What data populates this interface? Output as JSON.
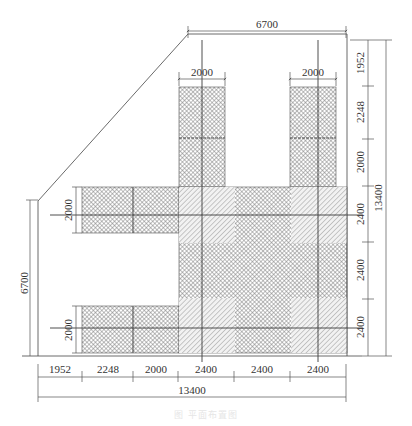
{
  "drawing": {
    "type": "structural plan with dimension lines",
    "colors": {
      "line": "#444444",
      "dim_line": "#555555",
      "crosshatch": "#8a8a8a",
      "diagonal_hatch": "#a8a8a8",
      "background": "#ffffff"
    },
    "top_dimensions": {
      "overall": "6700",
      "left_tower_width": "2000",
      "right_tower_width": "2000"
    },
    "right_dimensions": {
      "segments": [
        "1952",
        "2248",
        "2000",
        "2400",
        "2400",
        "2400"
      ],
      "overall": "13400"
    },
    "left_dimensions": {
      "overall": "6700",
      "upper_arm_width": "2000",
      "lower_arm_width": "2000"
    },
    "bottom_dimensions": {
      "segments": [
        "1952",
        "2248",
        "2000",
        "2400",
        "2400",
        "2400"
      ],
      "overall": "13400"
    },
    "caption": "图 平面布置图"
  }
}
